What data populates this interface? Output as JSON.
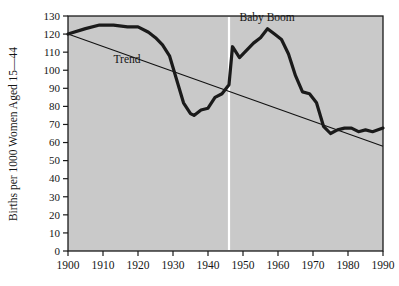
{
  "chart_data": {
    "type": "line",
    "title": "",
    "subtitle": "",
    "xlabel": "",
    "ylabel": "Births per 1000 Women Aged 15—44",
    "xlim": [
      1900,
      1990
    ],
    "ylim": [
      0,
      130
    ],
    "grid": false,
    "legend_position": "none",
    "background_color": "#c9c9c9",
    "axis_color": "#1a1a1a",
    "x_ticks": [
      1900,
      1910,
      1920,
      1930,
      1940,
      1950,
      1960,
      1970,
      1980,
      1990
    ],
    "x_tick_labels": [
      "1900",
      "1910",
      "1920",
      "1930",
      "1940",
      "1950",
      "1960",
      "1970",
      "1980",
      "1990"
    ],
    "y_ticks": [
      0,
      10,
      20,
      30,
      40,
      50,
      60,
      70,
      80,
      90,
      100,
      110,
      120,
      130
    ],
    "y_tick_labels": [
      "0",
      "10",
      "20",
      "30",
      "40",
      "50",
      "60",
      "70",
      "80",
      "90",
      "100",
      "110",
      "120",
      "130"
    ],
    "series": [
      {
        "name": "Birth rate",
        "color": "#1a1a1a",
        "line_width": 3.2,
        "x": [
          1900,
          1905,
          1909,
          1913,
          1917,
          1920,
          1923,
          1925,
          1927,
          1929,
          1931,
          1933,
          1935,
          1936,
          1938,
          1940,
          1942,
          1944,
          1946,
          1947,
          1949,
          1951,
          1953,
          1955,
          1957,
          1959,
          1961,
          1963,
          1965,
          1967,
          1969,
          1971,
          1973,
          1975,
          1977,
          1979,
          1981,
          1983,
          1985,
          1987,
          1990
        ],
        "y": [
          120,
          123,
          125,
          125,
          124,
          124,
          121,
          118,
          114,
          108,
          95,
          82,
          76,
          75,
          78,
          79,
          85,
          87,
          92,
          113,
          107,
          111,
          115,
          118,
          123,
          120,
          117,
          109,
          97,
          88,
          87,
          82,
          69,
          65,
          67,
          68,
          68,
          66,
          67,
          66,
          68
        ]
      },
      {
        "name": "Trend",
        "color": "#111111",
        "line_width": 1.1,
        "x": [
          1900,
          1990
        ],
        "y": [
          120,
          58
        ]
      }
    ],
    "annotations": [
      {
        "label": "Trend",
        "x": 1913,
        "y": 104,
        "type": "text-label"
      },
      {
        "label": "Baby Boom",
        "x": 1949,
        "y": 127,
        "type": "text-label"
      },
      {
        "label": "baby-boom-marker",
        "x": 1946,
        "type": "vertical-line",
        "color": "#ffffff"
      }
    ]
  }
}
